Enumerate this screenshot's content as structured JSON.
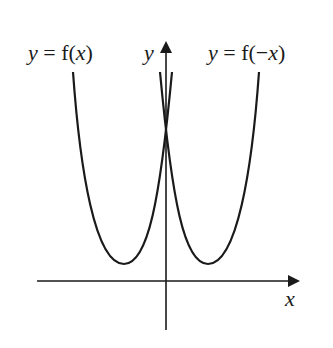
{
  "diagram": {
    "labels": {
      "left_curve": {
        "y": "y",
        "eq": " = f(",
        "x": "x",
        "close": ")"
      },
      "right_curve": {
        "y": "y",
        "eq": " = f(−",
        "x": "x",
        "close": ")"
      },
      "y_axis": "y",
      "x_axis": "x"
    },
    "curves": [
      {
        "name": "y = f(x)",
        "vertex_px": [
          124,
          264
        ],
        "position": "left"
      },
      {
        "name": "y = f(-x)",
        "vertex_px": [
          209,
          264
        ],
        "position": "right"
      }
    ],
    "intersection_px": [
      166,
      148
    ],
    "colors": {
      "stroke": "#1a1a1a",
      "background": "#ffffff"
    }
  }
}
